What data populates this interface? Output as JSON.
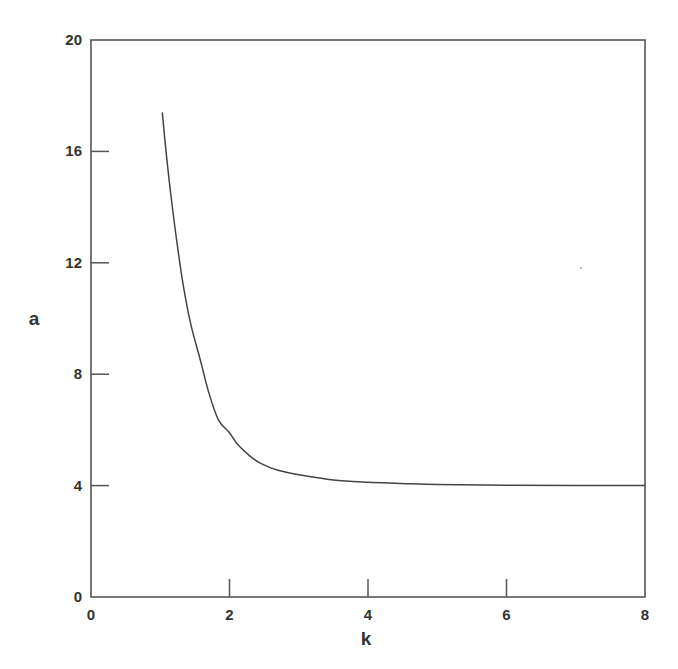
{
  "chart_data": {
    "type": "line",
    "title": "",
    "xlabel": "k",
    "ylabel": "a",
    "xlim": [
      0,
      8
    ],
    "ylim": [
      0,
      20
    ],
    "xticks": [
      0,
      2,
      4,
      6,
      8
    ],
    "yticks": [
      0,
      4,
      8,
      12,
      16,
      20
    ],
    "grid": false,
    "legend": null,
    "series": [
      {
        "name": "a(k)",
        "color": "#444444",
        "x": [
          1.03,
          1.1,
          1.2,
          1.3,
          1.37,
          1.45,
          1.58,
          1.7,
          1.84,
          2.0,
          2.11,
          2.3,
          2.45,
          2.7,
          3.02,
          3.5,
          4.0,
          4.47,
          5.0,
          6.0,
          7.0,
          8.0
        ],
        "y": [
          17.4,
          15.6,
          13.5,
          11.7,
          10.66,
          9.7,
          8.5,
          7.35,
          6.36,
          5.9,
          5.5,
          5.05,
          4.8,
          4.55,
          4.38,
          4.2,
          4.12,
          4.08,
          4.04,
          4.01,
          4.0,
          4.0
        ]
      }
    ]
  },
  "axes": {
    "x_label": "k",
    "y_label": "a",
    "x_tick_labels": [
      "0",
      "2",
      "4",
      "6",
      "8"
    ],
    "y_tick_labels": [
      "0",
      "4",
      "8",
      "12",
      "16",
      "20"
    ]
  }
}
